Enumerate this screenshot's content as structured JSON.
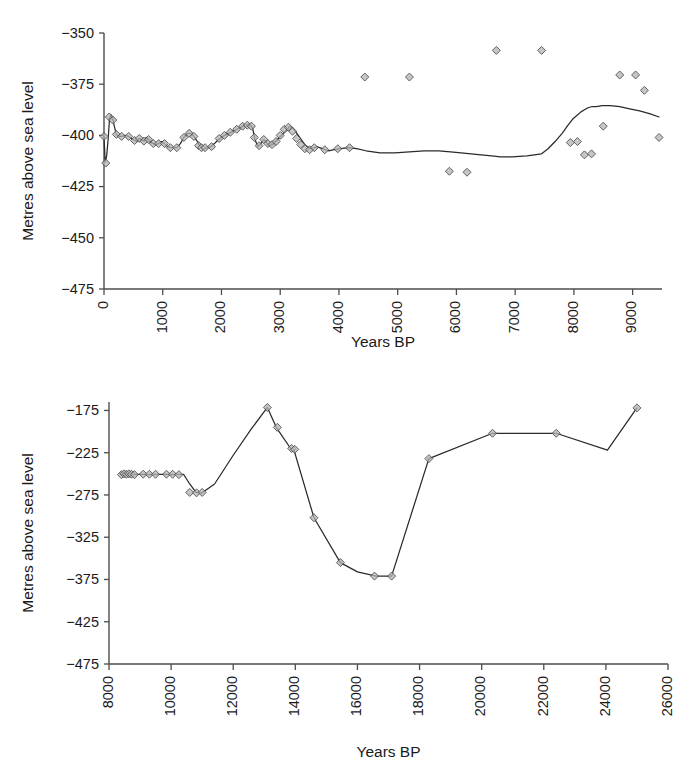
{
  "figure": {
    "background": "#ffffff",
    "marker_fill": "#b3b3b3",
    "line_color": "#2a2a2a",
    "axis_color": "#4d4d4d"
  },
  "chart_data": [
    {
      "id": "top-panel",
      "type": "line",
      "title": "",
      "xlabel": "Years BP",
      "ylabel": "Metres above sea level",
      "xlim": [
        0,
        9500
      ],
      "ylim": [
        -475,
        -350
      ],
      "xticks": [
        0,
        1000,
        2000,
        3000,
        4000,
        5000,
        6000,
        7000,
        8000,
        9000
      ],
      "xtick_labels": [
        "0",
        "1000",
        "2000",
        "3000",
        "4000",
        "5000",
        "6000",
        "7000",
        "8000",
        "9000"
      ],
      "yticks": [
        -350,
        -375,
        -400,
        -425,
        -450,
        -475
      ],
      "ytick_labels": [
        "−350",
        "−375",
        "−400",
        "−425",
        "−450",
        "−475"
      ],
      "grid": false,
      "legend": "none",
      "markers": "diamond",
      "series": [
        {
          "name": "Lake level",
          "x": [
            0,
            20,
            45,
            70,
            95,
            120,
            150,
            180,
            210,
            250,
            300,
            360,
            420,
            470,
            520,
            560,
            600,
            640,
            680,
            720,
            760,
            800,
            840,
            880,
            930,
            980,
            1030,
            1080,
            1130,
            1180,
            1240,
            1300,
            1360,
            1420,
            1480,
            1530,
            1580,
            1620,
            1660,
            1700,
            1760,
            1820,
            1880,
            1950,
            2020,
            2090,
            2160,
            2230,
            2300,
            2370,
            2430,
            2480,
            2530,
            2570,
            2620,
            2670,
            2720,
            2770,
            2820,
            2870,
            2920,
            2970,
            3020,
            3070,
            3120,
            3170,
            3220,
            3270,
            3320,
            3370,
            3420,
            3480,
            3540,
            3620,
            3720,
            3820,
            3920,
            4030,
            4150,
            4300,
            4460,
            4700,
            4950,
            5200,
            5450,
            5700,
            5900,
            6080,
            6250,
            6420,
            6600,
            6750,
            6950,
            7200,
            7450,
            7560,
            7680,
            7800,
            7900,
            7980,
            8060,
            8120,
            8180,
            8240,
            8300,
            8380,
            8480,
            8620,
            8780,
            8950,
            9120,
            9300,
            9450
          ],
          "y": [
            -400.5,
            -413.0,
            -410.0,
            -402.0,
            -391.5,
            -390.0,
            -392.0,
            -396.0,
            -399.5,
            -400.5,
            -400.5,
            -400.0,
            -400.5,
            -401.5,
            -402.5,
            -403.0,
            -401.5,
            -402.0,
            -402.8,
            -401.0,
            -402.0,
            -403.5,
            -404.0,
            -404.5,
            -404.0,
            -403.0,
            -404.0,
            -405.5,
            -406.0,
            -406.0,
            -406.0,
            -404.0,
            -401.0,
            -399.0,
            -399.0,
            -400.5,
            -402.5,
            -404.5,
            -406.0,
            -406.5,
            -406.0,
            -405.5,
            -404.0,
            -402.0,
            -400.5,
            -399.5,
            -398.5,
            -397.5,
            -396.5,
            -395.5,
            -395.0,
            -394.5,
            -396.5,
            -402.0,
            -405.5,
            -404.0,
            -402.0,
            -403.5,
            -405.0,
            -404.5,
            -403.0,
            -401.5,
            -400.0,
            -398.5,
            -397.0,
            -395.5,
            -396.5,
            -398.5,
            -400.5,
            -402.5,
            -404.5,
            -406.0,
            -406.5,
            -405.5,
            -406.5,
            -407.5,
            -407.0,
            -406.5,
            -406.0,
            -406.5,
            -407.5,
            -408.5,
            -408.5,
            -408.0,
            -407.5,
            -407.5,
            -408.0,
            -408.5,
            -409.0,
            -409.5,
            -410.0,
            -410.5,
            -410.5,
            -410.0,
            -409.0,
            -406.5,
            -403.0,
            -399.0,
            -395.0,
            -392.0,
            -390.0,
            -388.5,
            -387.5,
            -386.5,
            -386.0,
            -386.0,
            -385.5,
            -385.5,
            -386.0,
            -387.0,
            -388.0,
            -389.5,
            -391.0
          ]
        }
      ],
      "annotated_points": {
        "x": [
          0,
          30,
          90,
          150,
          210,
          300,
          420,
          520,
          600,
          680,
          760,
          840,
          930,
          1030,
          1130,
          1240,
          1360,
          1450,
          1530,
          1610,
          1660,
          1720,
          1830,
          1960,
          2050,
          2150,
          2260,
          2360,
          2440,
          2510,
          2560,
          2640,
          2720,
          2790,
          2860,
          2930,
          3000,
          3070,
          3140,
          3210,
          3280,
          3350,
          3420,
          3500,
          3580,
          3760,
          3980,
          4180,
          4440,
          5200,
          5880,
          6180,
          6680,
          7450,
          7940,
          8060,
          8180,
          8300,
          8500,
          8780,
          9050,
          9200,
          9450
        ],
        "y": [
          -400.5,
          -413.5,
          -391.0,
          -392.5,
          -399.5,
          -400.5,
          -400.5,
          -402.5,
          -401.5,
          -402.8,
          -402.0,
          -404.0,
          -404.0,
          -404.0,
          -406.0,
          -406.0,
          -401.0,
          -399.0,
          -400.5,
          -405.0,
          -406.0,
          -406.0,
          -405.5,
          -401.5,
          -400.0,
          -398.5,
          -397.0,
          -395.5,
          -395.0,
          -395.5,
          -401.0,
          -405.0,
          -402.0,
          -404.0,
          -404.5,
          -403.0,
          -400.0,
          -397.0,
          -396.0,
          -398.0,
          -401.5,
          -404.5,
          -406.5,
          -407.0,
          -406.0,
          -407.0,
          -406.5,
          -406.0,
          -371.5,
          -371.5,
          -417.5,
          -418.0,
          -358.5,
          -358.5,
          -403.5,
          -403.0,
          -409.5,
          -409.0,
          -395.5,
          -370.5,
          -370.5,
          -378.0,
          -401.0
        ]
      }
    },
    {
      "id": "bottom-panel",
      "type": "line",
      "title": "",
      "xlabel": "Years BP",
      "ylabel": "Metres above sea level",
      "xlim": [
        8000,
        26000
      ],
      "ylim": [
        -475,
        -165
      ],
      "xticks": [
        8000,
        10000,
        12000,
        14000,
        16000,
        18000,
        20000,
        22000,
        24000,
        26000
      ],
      "xtick_labels": [
        "8000",
        "10000",
        "12000",
        "14000",
        "16000",
        "18000",
        "20000",
        "22000",
        "24000",
        "26000"
      ],
      "yticks": [
        -175,
        -225,
        -275,
        -325,
        -375,
        -425,
        -475
      ],
      "ytick_labels": [
        "−175",
        "−225",
        "−275",
        "−325",
        "−375",
        "−425",
        "−475"
      ],
      "grid": false,
      "legend": "none",
      "markers": "diamond",
      "series": [
        {
          "name": "Lake level",
          "x": [
            8400,
            8520,
            8620,
            8720,
            8820,
            8950,
            9100,
            9300,
            9500,
            9700,
            9900,
            10050,
            10200,
            10400,
            10600,
            10800,
            11000,
            11400,
            12000,
            12600,
            13100,
            13400,
            13850,
            13950,
            14600,
            15450,
            16000,
            16600,
            17100,
            18300,
            20350,
            22400,
            24050,
            25000
          ],
          "y": [
            -251.0,
            -250.5,
            -250.0,
            -250.5,
            -251.0,
            -250.5,
            -250.5,
            -251.0,
            -250.5,
            -250.5,
            -250.5,
            -251.0,
            -250.5,
            -250.5,
            -262.0,
            -272.0,
            -272.5,
            -262.0,
            -228.0,
            -196.0,
            -171.5,
            -196.0,
            -220.0,
            -221.0,
            -302.0,
            -355.0,
            -366.0,
            -371.0,
            -371.0,
            -232.0,
            -202.0,
            -202.0,
            -222.0,
            -172.0
          ]
        }
      ],
      "annotated_points": {
        "x": [
          8400,
          8480,
          8560,
          8640,
          8720,
          8820,
          9100,
          9300,
          9500,
          9850,
          10050,
          10250,
          10600,
          10820,
          11000,
          13100,
          13420,
          13880,
          13980,
          14600,
          15450,
          16550,
          17100,
          18300,
          20350,
          22400,
          25000
        ],
        "y": [
          -251.0,
          -250.0,
          -250.5,
          -250.0,
          -250.5,
          -251.0,
          -250.5,
          -250.5,
          -250.5,
          -250.5,
          -250.5,
          -251.0,
          -272.0,
          -272.5,
          -272.0,
          -171.5,
          -195.0,
          -220.0,
          -221.0,
          -302.0,
          -355.0,
          -371.0,
          -371.0,
          -232.0,
          -202.0,
          -202.0,
          -172.0
        ]
      }
    }
  ]
}
